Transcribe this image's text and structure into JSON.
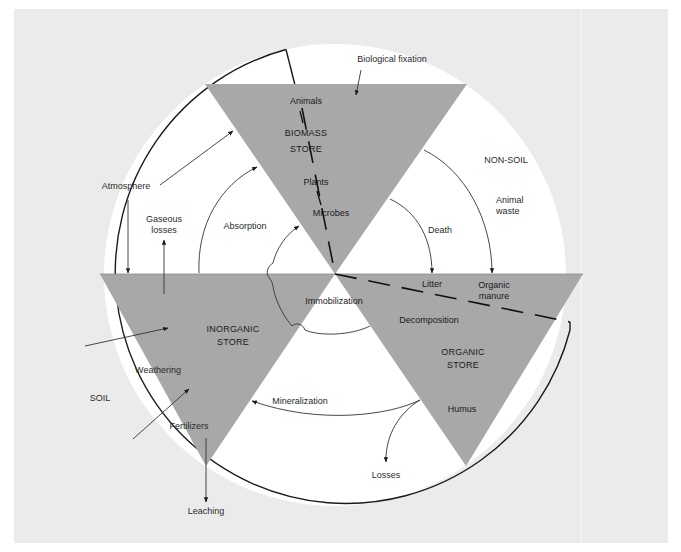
{
  "colors": {
    "background_panel": "#ebebeb",
    "outer_background": "#ffffff",
    "circle_fill": "#ffffff",
    "store_fill": "#a8a8a8",
    "line": "#1a1a1a"
  },
  "regions": {
    "non_soil": "NON-SOIL",
    "soil": "SOIL"
  },
  "stores": {
    "biomass": {
      "line1": "BIOMASS",
      "line2": "STORE",
      "components": [
        "Animals",
        "Plants",
        "Microbes"
      ]
    },
    "inorganic": {
      "line1": "INORGANIC",
      "line2": "STORE"
    },
    "organic": {
      "line1": "ORGANIC",
      "line2": "STORE",
      "components": [
        "Litter",
        "Organic",
        "manure",
        "Humus"
      ]
    }
  },
  "flows": {
    "biological_fixation": "Biological fixation",
    "atmosphere": "Atmosphere",
    "gaseous_losses_1": "Gaseous",
    "gaseous_losses_2": "losses",
    "absorption": "Absorption",
    "death": "Death",
    "animal_waste_1": "Animal",
    "animal_waste_2": "waste",
    "immobilization": "Immobilization",
    "decomposition": "Decomposition",
    "weathering": "Weathering",
    "fertilizers": "Fertilizers",
    "mineralization": "Mineralization",
    "losses": "Losses",
    "leaching": "Leaching"
  }
}
